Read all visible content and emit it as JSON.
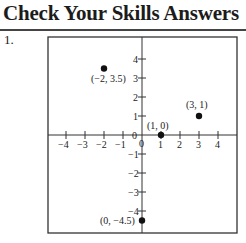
{
  "heading": {
    "title": "Check Your Skills Answers"
  },
  "problem": {
    "number": "1."
  },
  "chart_data": {
    "type": "scatter",
    "title": "",
    "xlabel": "",
    "ylabel": "",
    "xlim": [
      -4.5,
      5
    ],
    "ylim": [
      -5,
      5
    ],
    "x_ticks": [
      -4,
      -3,
      -2,
      -1,
      0,
      1,
      2,
      3,
      4
    ],
    "y_ticks": [
      -4,
      -3,
      -2,
      -1,
      0,
      1,
      2,
      3,
      4
    ],
    "x_tick_labels": [
      "−4",
      "−3",
      "−2",
      "−1",
      "0",
      "1",
      "2",
      "3",
      "4"
    ],
    "y_tick_labels": [
      "−4",
      "−3",
      "−2",
      "−1",
      "0",
      "1",
      "2",
      "3",
      "4"
    ],
    "grid": false,
    "legend": null,
    "points": [
      {
        "x": -2,
        "y": 3.5,
        "label": "(−2, 3.5)"
      },
      {
        "x": 3,
        "y": 1,
        "label": "(3, 1)"
      },
      {
        "x": 1,
        "y": 0,
        "label": "(1, 0)"
      },
      {
        "x": 0,
        "y": -4.5,
        "label": "(0, −4.5)"
      }
    ]
  }
}
